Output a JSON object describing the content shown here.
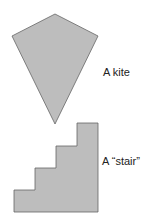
{
  "shapes": [
    {
      "name": "kite",
      "label": "A kite",
      "fill": "#bdbdbd",
      "stroke": "#666666"
    },
    {
      "name": "stair",
      "label": "A “stair”",
      "fill": "#bdbdbd",
      "stroke": "#666666"
    }
  ]
}
